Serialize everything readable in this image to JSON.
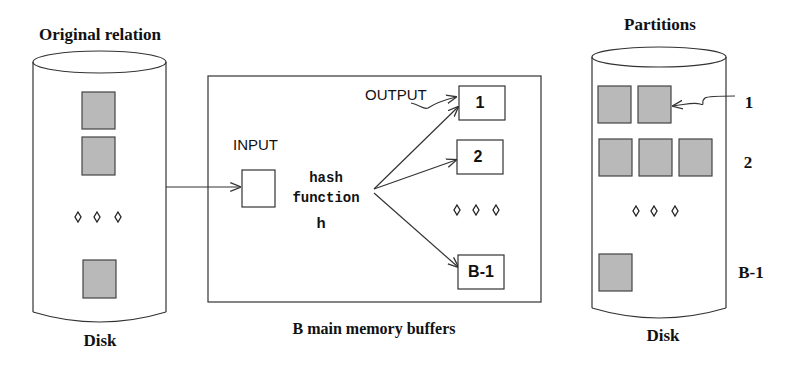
{
  "left_disk": {
    "title": "Original relation",
    "caption": "Disk",
    "pages": 3,
    "ellipsis": "◊ ◊ ◊"
  },
  "memory": {
    "caption": "B main memory buffers",
    "input_label": "INPUT",
    "output_label": "OUTPUT",
    "hash_line1": "hash",
    "hash_line2": "function",
    "hash_line3": "h",
    "output_buffers": [
      "1",
      "2",
      "B-1"
    ],
    "ellipsis": "◊ ◊ ◊"
  },
  "right_disk": {
    "title": "Partitions",
    "caption": "Disk",
    "partition_labels": [
      "1",
      "2",
      "B-1"
    ],
    "partition_page_counts": [
      2,
      3,
      1
    ],
    "ellipsis": "◊ ◊ ◊"
  },
  "colors": {
    "page_fill": "#b9b9b9",
    "stroke": "#333333",
    "background": "#ffffff"
  }
}
